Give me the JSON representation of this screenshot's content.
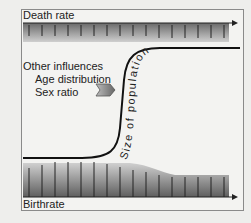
{
  "diagram": {
    "top_label": "Death rate",
    "bottom_label": "Birthrate",
    "influences_title": "Other influences",
    "influences": [
      "Age distribution",
      "Sex ratio"
    ],
    "curve_label": "Size of population",
    "colors": {
      "band_dark": "#5e5e5e",
      "band_light": "#c8c8c8",
      "frame": "#8a8a8a",
      "curve": "#111111"
    }
  }
}
